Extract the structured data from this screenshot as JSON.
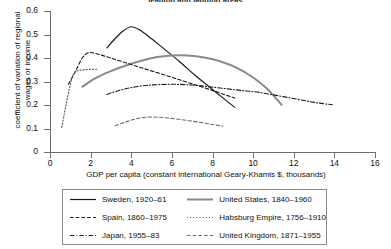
{
  "chart_data": {
    "type": "line",
    "title": "leading and lagging areas",
    "xlabel": "GDP per capita (constant international Geary-Khamis $, thousands)",
    "ylabel": "coefficient of variation of regional wages or income",
    "xlim": [
      0,
      16
    ],
    "ylim": [
      0,
      0.6
    ],
    "xticks": [
      "0",
      "2",
      "4",
      "6",
      "8",
      "10",
      "12",
      "14",
      "16"
    ],
    "yticks": [
      "0",
      "0.1",
      "0.2",
      "0.3",
      "0.4",
      "0.5",
      "0.6"
    ],
    "grid": false,
    "legend_position": "bottom",
    "series": [
      {
        "name": "Sweden, 1920–61",
        "style": "solid",
        "color": "#1a1a1a",
        "width": 1.2,
        "points": [
          [
            2.8,
            0.443
          ],
          [
            3.2,
            0.482
          ],
          [
            3.6,
            0.515
          ],
          [
            4.0,
            0.533
          ],
          [
            4.4,
            0.52
          ],
          [
            5.0,
            0.482
          ],
          [
            5.6,
            0.44
          ],
          [
            6.4,
            0.383
          ],
          [
            7.2,
            0.322
          ],
          [
            8.0,
            0.266
          ],
          [
            8.6,
            0.224
          ],
          [
            9.1,
            0.19
          ]
        ]
      },
      {
        "name": "United States, 1840–1960",
        "style": "solid",
        "color": "#8a8a8a",
        "width": 2.0,
        "points": [
          [
            1.6,
            0.278
          ],
          [
            2.2,
            0.312
          ],
          [
            2.9,
            0.341
          ],
          [
            3.6,
            0.364
          ],
          [
            4.4,
            0.386
          ],
          [
            5.2,
            0.403
          ],
          [
            6.0,
            0.411
          ],
          [
            6.8,
            0.411
          ],
          [
            7.6,
            0.402
          ],
          [
            8.4,
            0.385
          ],
          [
            9.2,
            0.358
          ],
          [
            10.0,
            0.317
          ],
          [
            10.7,
            0.268
          ],
          [
            11.4,
            0.201
          ]
        ]
      },
      {
        "name": "Spain, 1860–1975",
        "style": "dashed",
        "color": "#1a1a1a",
        "width": 1.1,
        "points": [
          [
            0.9,
            0.288
          ],
          [
            1.1,
            0.318
          ],
          [
            1.3,
            0.352
          ],
          [
            1.6,
            0.402
          ],
          [
            1.9,
            0.423
          ],
          [
            2.2,
            0.42
          ],
          [
            3.0,
            0.4
          ],
          [
            4.0,
            0.372
          ],
          [
            5.0,
            0.345
          ],
          [
            6.0,
            0.318
          ],
          [
            7.0,
            0.29
          ],
          [
            8.0,
            0.262
          ],
          [
            8.8,
            0.238
          ],
          [
            9.1,
            0.23
          ]
        ]
      },
      {
        "name": "Habsburg Empire, 1756–1910",
        "style": "dotted",
        "color": "#5a5a5a",
        "width": 1.2,
        "points": [
          [
            0.58,
            0.105
          ],
          [
            0.7,
            0.16
          ],
          [
            0.82,
            0.215
          ],
          [
            0.95,
            0.268
          ],
          [
            1.05,
            0.305
          ],
          [
            1.15,
            0.33
          ],
          [
            1.3,
            0.344
          ],
          [
            1.55,
            0.349
          ],
          [
            1.85,
            0.351
          ],
          [
            2.15,
            0.352
          ],
          [
            2.35,
            0.352
          ]
        ]
      },
      {
        "name": "Japan, 1955–83",
        "style": "dashdot",
        "color": "#1a1a1a",
        "width": 1.1,
        "points": [
          [
            2.8,
            0.245
          ],
          [
            3.4,
            0.262
          ],
          [
            4.0,
            0.274
          ],
          [
            4.7,
            0.283
          ],
          [
            5.4,
            0.287
          ],
          [
            6.2,
            0.288
          ],
          [
            7.0,
            0.285
          ],
          [
            7.8,
            0.278
          ],
          [
            8.6,
            0.27
          ],
          [
            9.4,
            0.262
          ],
          [
            10.2,
            0.255
          ],
          [
            11.2,
            0.24
          ],
          [
            12.2,
            0.224
          ],
          [
            13.1,
            0.21
          ],
          [
            13.9,
            0.201
          ]
        ]
      },
      {
        "name": "United Kingdom, 1871–1955",
        "style": "dashed",
        "color": "#6b6b6b",
        "width": 1.1,
        "points": [
          [
            3.2,
            0.112
          ],
          [
            3.6,
            0.124
          ],
          [
            4.1,
            0.138
          ],
          [
            4.7,
            0.148
          ],
          [
            5.3,
            0.148
          ],
          [
            6.0,
            0.143
          ],
          [
            6.7,
            0.135
          ],
          [
            7.4,
            0.126
          ],
          [
            8.0,
            0.117
          ],
          [
            8.5,
            0.11
          ]
        ]
      }
    ]
  },
  "legend": {
    "items": [
      {
        "label": "Sweden, 1920–61"
      },
      {
        "label": "United States, 1840–1960"
      },
      {
        "label": "Spain, 1860–1975"
      },
      {
        "label": "Habsburg Empire, 1756–1910"
      },
      {
        "label": "Japan, 1955–83"
      },
      {
        "label": "United Kingdom, 1871–1955"
      }
    ]
  }
}
